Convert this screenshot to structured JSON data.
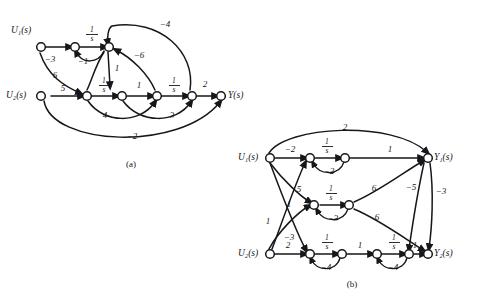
{
  "figure": {
    "captions": [
      {
        "key": "a",
        "text": "(a)"
      },
      {
        "key": "b",
        "text": "(b)"
      }
    ],
    "ink_color": "#17161a",
    "background_color": "#ffffff"
  },
  "graph_a": {
    "caption": "(a)",
    "inputs": [
      {
        "id": "u1",
        "label": "U₁(s)"
      },
      {
        "id": "u2",
        "label": "U₂(s)"
      }
    ],
    "outputs": [
      {
        "id": "y",
        "label": "Y(s)"
      }
    ],
    "edges": [
      {
        "from": "u1",
        "to": "n1",
        "gain": "−3"
      },
      {
        "from": "n1",
        "to": "n2",
        "gain": "1/s",
        "numerator": "1",
        "denominator": "s"
      },
      {
        "from": "n2",
        "to": "n1",
        "gain": "−1"
      },
      {
        "from": "u1",
        "to": "n3",
        "gain": "6"
      },
      {
        "from": "n2",
        "to": "n3",
        "gain": "1"
      },
      {
        "from": "u2",
        "to": "n3",
        "gain": "5"
      },
      {
        "from": "n3",
        "to": "n4",
        "gain": "1/s",
        "numerator": "1",
        "denominator": "s"
      },
      {
        "from": "n4",
        "to": "n5",
        "gain": "1"
      },
      {
        "from": "n5",
        "to": "n6",
        "gain": "1/s",
        "numerator": "1",
        "denominator": "s"
      },
      {
        "from": "n6",
        "to": "y",
        "gain": "2"
      },
      {
        "from": "n6",
        "to": "n2",
        "gain": "−4"
      },
      {
        "from": "n5",
        "to": "n2",
        "gain": "−6"
      },
      {
        "from": "n3",
        "to": "n5",
        "gain": "4"
      },
      {
        "from": "n4",
        "to": "n6",
        "gain": "3"
      },
      {
        "from": "u2",
        "to": "y",
        "gain": "−2"
      }
    ],
    "gain_labels": [
      "−3",
      "1/s",
      "−1",
      "6",
      "1",
      "5",
      "1/s",
      "1",
      "1/s",
      "2",
      "−4",
      "−6",
      "4",
      "3",
      "−2"
    ]
  },
  "graph_b": {
    "caption": "(b)",
    "inputs": [
      {
        "id": "u1",
        "label": "U₁(s)"
      },
      {
        "id": "u2",
        "label": "U₂(s)"
      }
    ],
    "outputs": [
      {
        "id": "y1",
        "label": "Y₁(s)"
      },
      {
        "id": "y2",
        "label": "Y₂(s)"
      }
    ],
    "edges": [
      {
        "from": "u1",
        "to": "y1",
        "gain": "2"
      },
      {
        "from": "u1",
        "to": "a1",
        "gain": "−2"
      },
      {
        "from": "a1",
        "to": "a2",
        "gain": "1/s",
        "numerator": "1",
        "denominator": "s"
      },
      {
        "from": "a2",
        "to": "a1",
        "gain": "−2"
      },
      {
        "from": "a2",
        "to": "y1",
        "gain": "1"
      },
      {
        "from": "u1",
        "to": "b1",
        "gain": "5"
      },
      {
        "from": "b1",
        "to": "b2",
        "gain": "1/s",
        "numerator": "1",
        "denominator": "s"
      },
      {
        "from": "b2",
        "to": "b1",
        "gain": "−3"
      },
      {
        "from": "b2",
        "to": "y1",
        "gain": "6"
      },
      {
        "from": "b2",
        "to": "y2",
        "gain": "6"
      },
      {
        "from": "u1",
        "to": "c1",
        "gain": "1"
      },
      {
        "from": "u2",
        "to": "b1",
        "gain": "1"
      },
      {
        "from": "u2",
        "to": "a1",
        "gain": "−3"
      },
      {
        "from": "u2",
        "to": "c1",
        "gain": "2"
      },
      {
        "from": "c1",
        "to": "c2",
        "gain": "1/s",
        "numerator": "1",
        "denominator": "s"
      },
      {
        "from": "c2",
        "to": "c1",
        "gain": "−4"
      },
      {
        "from": "c2",
        "to": "c3",
        "gain": "1"
      },
      {
        "from": "c3",
        "to": "c4",
        "gain": "1/s",
        "numerator": "1",
        "denominator": "s"
      },
      {
        "from": "c4",
        "to": "c3",
        "gain": "−4"
      },
      {
        "from": "c4",
        "to": "y2",
        "gain": "1"
      },
      {
        "from": "y1",
        "to": "y2",
        "gain": "−3"
      },
      {
        "from": "y1",
        "to": "c4",
        "gain": "−5"
      }
    ],
    "gain_labels": [
      "2",
      "−2",
      "1/s",
      "−2",
      "1",
      "5",
      "1/s",
      "−3",
      "6",
      "6",
      "1",
      "1",
      "−3",
      "2",
      "1/s",
      "−4",
      "1",
      "1/s",
      "−4",
      "1",
      "−3",
      "−5"
    ]
  }
}
